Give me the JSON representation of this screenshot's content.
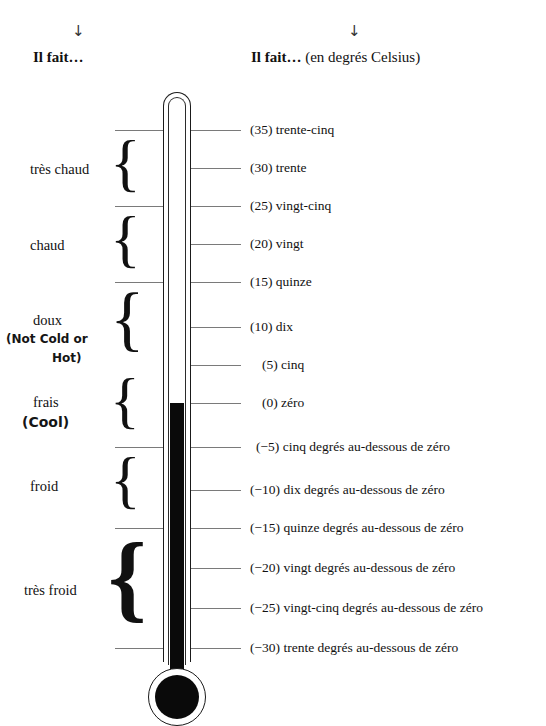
{
  "headers": {
    "arrow_glyph": "↓",
    "left": {
      "bold": "Il fait…",
      "sub": ""
    },
    "right": {
      "bold": "Il fait…",
      "sub": " (en degrés Celsius)"
    }
  },
  "scale": {
    "unit": "degrés Celsius",
    "readings": [
      {
        "value": 35,
        "text": "(35) trente-cinq",
        "tick": "long"
      },
      {
        "value": 30,
        "text": "(30) trente",
        "tick": "short"
      },
      {
        "value": 25,
        "text": "(25) vingt-cinq",
        "tick": "long"
      },
      {
        "value": 20,
        "text": "(20) vingt",
        "tick": "short"
      },
      {
        "value": 15,
        "text": "(15) quinze",
        "tick": "long"
      },
      {
        "value": 10,
        "text": "(10) dix",
        "tick": "short"
      },
      {
        "value": 5,
        "text": "(5) cinq",
        "tick": "short"
      },
      {
        "value": 0,
        "text": "(0) zéro",
        "tick": "short"
      },
      {
        "value": -5,
        "text": "(−5) cinq degrés au-dessous de zéro",
        "tick": "long"
      },
      {
        "value": -10,
        "text": "(−10) dix degrés au-dessous de zéro",
        "tick": "short"
      },
      {
        "value": -15,
        "text": "(−15) quinze degrés au-dessous de zéro",
        "tick": "long"
      },
      {
        "value": -20,
        "text": "(−20) vingt degrés au-dessous de zéro",
        "tick": "short"
      },
      {
        "value": -25,
        "text": "(−25) vingt-cinq degrés au-dessous de zéro",
        "tick": "short"
      },
      {
        "value": -30,
        "text": "(−30) trente degrés au-dessous de zéro",
        "tick": "long"
      }
    ]
  },
  "categories": [
    {
      "label": "très chaud",
      "range": "35 to 25",
      "annotation": null
    },
    {
      "label": "chaud",
      "range": "25 to 15",
      "annotation": null
    },
    {
      "label": "doux",
      "range": "15 to 5",
      "annotation": {
        "line1": "(Not Cold or",
        "line2": "Hot)"
      }
    },
    {
      "label": "frais",
      "range": "5 to -5",
      "annotation": {
        "line1": "(Cool)",
        "line2": null
      }
    },
    {
      "label": "froid",
      "range": "-5 to -15",
      "annotation": null
    },
    {
      "label": "très froid",
      "range": "-15 to -30",
      "annotation": null
    }
  ],
  "thermometer": {
    "fill_top_value": 0,
    "fill_color": "#0a0a0a",
    "glass_color": "#1a1a1a",
    "tick_color": "#7a7a7a"
  }
}
